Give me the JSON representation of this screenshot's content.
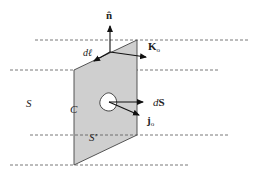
{
  "diagram": {
    "type": "surface-current-geometry",
    "colors": {
      "surface_fill": "#cfcfcf",
      "stroke": "#333333",
      "dash": "#555555",
      "hole_fill": "#ffffff"
    },
    "labels": {
      "normal": "n̂",
      "dl": "dℓ",
      "K": "K",
      "K_sub": "o",
      "dS_d": "d",
      "dS_S": "S",
      "j": "j",
      "j_sub": "o",
      "S": "S",
      "C": "C",
      "S_prime": "S′"
    },
    "dashed_lines": [
      {
        "y": 40,
        "x1": 35,
        "x2": 248
      },
      {
        "y": 70,
        "x1": 10,
        "x2": 218
      },
      {
        "y": 135,
        "x1": 30,
        "x2": 230
      },
      {
        "y": 165,
        "x1": 10,
        "x2": 190
      }
    ]
  }
}
